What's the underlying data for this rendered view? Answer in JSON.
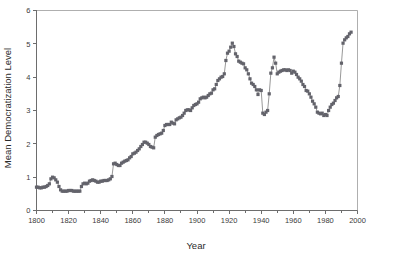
{
  "chart_data": {
    "type": "line",
    "title": "",
    "xlabel": "Year",
    "ylabel": "Mean Democratization Level",
    "xlim": [
      1800,
      2000
    ],
    "ylim": [
      0,
      6
    ],
    "xticks": [
      1800,
      1820,
      1840,
      1860,
      1880,
      1900,
      1920,
      1940,
      1960,
      1980,
      2000
    ],
    "xtick_labels": [
      "1800",
      "1820",
      "1840",
      "1860",
      "1880",
      "1900",
      "1920",
      "1940",
      "1960",
      "1980",
      "2000"
    ],
    "minor_xtick_interval": 10,
    "yticks": [
      0,
      1,
      2,
      3,
      4,
      5,
      6
    ],
    "ytick_labels": [
      "0",
      "1",
      "2",
      "3",
      "4",
      "5",
      "6"
    ],
    "grid": false,
    "legend": false,
    "marker": "square",
    "marker_color": "#63636b",
    "line_color": "#6b6b6b",
    "series": [
      {
        "name": "Mean Democratization Level",
        "x": [
          1800,
          1801,
          1802,
          1803,
          1804,
          1805,
          1806,
          1807,
          1808,
          1809,
          1810,
          1811,
          1812,
          1813,
          1814,
          1815,
          1816,
          1817,
          1818,
          1819,
          1820,
          1821,
          1822,
          1823,
          1824,
          1825,
          1826,
          1827,
          1828,
          1829,
          1830,
          1831,
          1832,
          1833,
          1834,
          1835,
          1836,
          1837,
          1838,
          1839,
          1840,
          1841,
          1842,
          1843,
          1844,
          1845,
          1846,
          1847,
          1848,
          1849,
          1850,
          1851,
          1852,
          1853,
          1854,
          1855,
          1856,
          1857,
          1858,
          1859,
          1860,
          1861,
          1862,
          1863,
          1864,
          1865,
          1866,
          1867,
          1868,
          1869,
          1870,
          1871,
          1872,
          1873,
          1874,
          1875,
          1876,
          1877,
          1878,
          1879,
          1880,
          1881,
          1882,
          1883,
          1884,
          1885,
          1886,
          1887,
          1888,
          1889,
          1890,
          1891,
          1892,
          1893,
          1894,
          1895,
          1896,
          1897,
          1898,
          1899,
          1900,
          1901,
          1902,
          1903,
          1904,
          1905,
          1906,
          1907,
          1908,
          1909,
          1910,
          1911,
          1912,
          1913,
          1914,
          1915,
          1916,
          1917,
          1918,
          1919,
          1920,
          1921,
          1922,
          1923,
          1924,
          1925,
          1926,
          1927,
          1928,
          1929,
          1930,
          1931,
          1932,
          1933,
          1934,
          1935,
          1936,
          1937,
          1938,
          1939,
          1940,
          1941,
          1942,
          1943,
          1944,
          1945,
          1946,
          1947,
          1948,
          1949,
          1950,
          1951,
          1952,
          1953,
          1954,
          1955,
          1956,
          1957,
          1958,
          1959,
          1960,
          1961,
          1962,
          1963,
          1964,
          1965,
          1966,
          1967,
          1968,
          1969,
          1970,
          1971,
          1972,
          1973,
          1974,
          1975,
          1976,
          1977,
          1978,
          1979,
          1980,
          1981,
          1982,
          1983,
          1984,
          1985,
          1986,
          1987,
          1988,
          1989,
          1990,
          1991,
          1992,
          1993,
          1994,
          1995,
          1996
        ],
        "values": [
          0.7,
          0.7,
          0.68,
          0.68,
          0.7,
          0.7,
          0.72,
          0.75,
          0.8,
          0.95,
          1.0,
          0.98,
          0.92,
          0.85,
          0.72,
          0.62,
          0.58,
          0.58,
          0.58,
          0.58,
          0.6,
          0.6,
          0.6,
          0.58,
          0.58,
          0.58,
          0.58,
          0.58,
          0.72,
          0.8,
          0.82,
          0.8,
          0.82,
          0.88,
          0.9,
          0.92,
          0.9,
          0.88,
          0.85,
          0.85,
          0.88,
          0.88,
          0.9,
          0.9,
          0.9,
          0.92,
          0.95,
          1.02,
          1.4,
          1.42,
          1.38,
          1.35,
          1.35,
          1.42,
          1.45,
          1.48,
          1.5,
          1.52,
          1.58,
          1.62,
          1.7,
          1.72,
          1.75,
          1.8,
          1.85,
          1.92,
          1.98,
          2.05,
          2.05,
          2.02,
          1.98,
          1.92,
          1.9,
          1.88,
          2.2,
          2.25,
          2.28,
          2.3,
          2.32,
          2.4,
          2.55,
          2.58,
          2.58,
          2.58,
          2.65,
          2.62,
          2.6,
          2.72,
          2.75,
          2.78,
          2.8,
          2.85,
          2.92,
          3.0,
          3.02,
          3.02,
          3.0,
          3.08,
          3.15,
          3.18,
          3.2,
          3.25,
          3.35,
          3.38,
          3.4,
          3.38,
          3.4,
          3.45,
          3.5,
          3.52,
          3.62,
          3.65,
          3.78,
          3.9,
          3.95,
          4.0,
          4.02,
          4.1,
          4.5,
          4.72,
          4.78,
          4.9,
          5.02,
          4.92,
          4.7,
          4.62,
          4.48,
          4.45,
          4.42,
          4.4,
          4.28,
          4.22,
          4.1,
          3.95,
          3.82,
          3.78,
          3.72,
          3.62,
          3.48,
          3.62,
          3.6,
          2.92,
          2.88,
          2.95,
          3.0,
          3.5,
          4.12,
          4.28,
          4.6,
          4.42,
          4.1,
          4.15,
          4.18,
          4.2,
          4.22,
          4.22,
          4.2,
          4.22,
          4.2,
          4.12,
          4.18,
          4.15,
          4.08,
          4.0,
          3.95,
          3.88,
          3.78,
          3.72,
          3.6,
          3.58,
          3.5,
          3.4,
          3.28,
          3.2,
          3.1,
          2.95,
          2.92,
          2.9,
          2.92,
          2.85,
          2.88,
          2.85,
          3.0,
          3.1,
          3.18,
          3.22,
          3.3,
          3.38,
          3.42,
          3.75,
          4.42,
          5.02,
          5.12,
          5.18,
          5.22,
          5.3,
          5.35
        ]
      }
    ],
    "annotations": []
  }
}
